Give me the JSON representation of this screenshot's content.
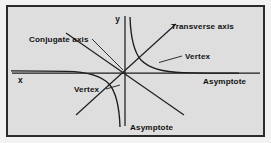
{
  "figure": {
    "type": "hyperbola-diagram",
    "background_color": "#dedede",
    "border_color": "#2b2b2b",
    "ink_color": "#1c1c1c",
    "axes": {
      "x_label": "x",
      "y_label": "y",
      "origin": {
        "x": 117,
        "y": 66
      },
      "x_axis": {
        "x1": 4,
        "y1": 66,
        "x2": 252,
        "y2": 66
      },
      "y_axis": {
        "x1": 117,
        "y1": 9,
        "x2": 117,
        "y2": 119
      }
    },
    "labels": [
      {
        "id": "conjugate-axis",
        "text": "Conjugate axis",
        "x": 22,
        "y": 35,
        "anchor": "start",
        "leader": {
          "x1": 85,
          "y1": 33,
          "x2": 116,
          "y2": 64
        }
      },
      {
        "id": "transverse-axis",
        "text": "Transverse axis",
        "x": 164,
        "y": 22,
        "anchor": "start",
        "leader": null
      },
      {
        "id": "vertex-upper",
        "text": "Vertex",
        "x": 176,
        "y": 52,
        "anchor": "start",
        "leader": {
          "x1": 173,
          "y1": 49,
          "x2": 152,
          "y2": 55
        }
      },
      {
        "id": "vertex-lower",
        "text": "Vertex",
        "x": 67,
        "y": 85,
        "anchor": "start",
        "leader": {
          "x1": 99,
          "y1": 82,
          "x2": 112,
          "y2": 79
        }
      },
      {
        "id": "asymptote-right",
        "text": "Asymptote",
        "x": 196,
        "y": 76,
        "anchor": "start",
        "leader": null
      },
      {
        "id": "asymptote-bottom",
        "text": "Asymptote",
        "x": 121,
        "y": 122,
        "anchor": "start",
        "leader": null
      }
    ],
    "curves": {
      "upper_right_branch": "M 123 9 C 123.5 30, 128 49, 143 58 C 158 66, 196 65.5, 228 65.6",
      "lower_left_branch": "M 111 119 C 110.5 98, 106 79, 91 70 C 76 62, 38 62.5, 6 62.4",
      "transverse_axis_line": "M 111 75 L 171 18",
      "conjugate_asymptote_line": "M 85 33 L 165 104",
      "steep_asymptote_upper": "M 117 9 L 117 66",
      "steep_asymptote_lower": "M 117 66 L 117 119"
    },
    "asymptote_segments": [
      {
        "id": "asym-diag-main",
        "x1": 70,
        "y1": 104,
        "x2": 166,
        "y2": 19
      },
      {
        "id": "asym-diag-second",
        "x1": 50,
        "y1": 27,
        "x2": 172,
        "y2": 106
      }
    ]
  }
}
